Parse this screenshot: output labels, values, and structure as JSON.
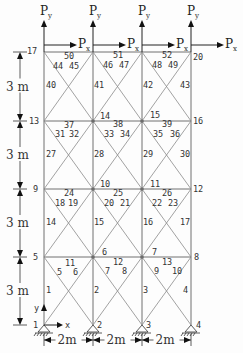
{
  "diagram": {
    "type": "truss-frame",
    "nodes": [
      {
        "id": "1",
        "x": 44,
        "y": 325
      },
      {
        "id": "2",
        "x": 93,
        "y": 325
      },
      {
        "id": "3",
        "x": 142,
        "y": 325
      },
      {
        "id": "4",
        "x": 191,
        "y": 325
      },
      {
        "id": "5",
        "x": 44,
        "y": 257
      },
      {
        "id": "6",
        "x": 93,
        "y": 257
      },
      {
        "id": "7",
        "x": 142,
        "y": 257
      },
      {
        "id": "8",
        "x": 191,
        "y": 257
      },
      {
        "id": "9",
        "x": 44,
        "y": 189
      },
      {
        "id": "10",
        "x": 93,
        "y": 189
      },
      {
        "id": "11",
        "x": 142,
        "y": 189
      },
      {
        "id": "12",
        "x": 191,
        "y": 189
      },
      {
        "id": "13",
        "x": 44,
        "y": 121
      },
      {
        "id": "14",
        "x": 93,
        "y": 121
      },
      {
        "id": "15",
        "x": 142,
        "y": 121
      },
      {
        "id": "16",
        "x": 191,
        "y": 121
      },
      {
        "id": "17",
        "x": 44,
        "y": 52
      },
      {
        "id": "18",
        "x": 93,
        "y": 52
      },
      {
        "id": "19",
        "x": 142,
        "y": 52
      },
      {
        "id": "20",
        "x": 191,
        "y": 52
      }
    ],
    "node_labels": [
      {
        "text": "1",
        "x": 33,
        "y": 328
      },
      {
        "text": "2",
        "x": 97,
        "y": 328
      },
      {
        "text": "3",
        "x": 146,
        "y": 328
      },
      {
        "text": "4",
        "x": 196,
        "y": 328
      },
      {
        "text": "5",
        "x": 33,
        "y": 260
      },
      {
        "text": "6",
        "x": 102,
        "y": 255
      },
      {
        "text": "7",
        "x": 152,
        "y": 255
      },
      {
        "text": "8",
        "x": 194,
        "y": 260
      },
      {
        "text": "9",
        "x": 33,
        "y": 192
      },
      {
        "text": "10",
        "x": 100,
        "y": 187
      },
      {
        "text": "11",
        "x": 150,
        "y": 187
      },
      {
        "text": "12",
        "x": 193,
        "y": 192
      },
      {
        "text": "13",
        "x": 29,
        "y": 124
      },
      {
        "text": "14",
        "x": 100,
        "y": 119
      },
      {
        "text": "15",
        "x": 150,
        "y": 118
      },
      {
        "text": "16",
        "x": 193,
        "y": 124
      },
      {
        "text": "17",
        "x": 27,
        "y": 54
      },
      {
        "text": "20",
        "x": 193,
        "y": 60
      }
    ],
    "member_labels": [
      {
        "text": "1",
        "x": 46,
        "y": 293
      },
      {
        "text": "2",
        "x": 94,
        "y": 293
      },
      {
        "text": "3",
        "x": 143,
        "y": 293
      },
      {
        "text": "4",
        "x": 183,
        "y": 293
      },
      {
        "text": "5",
        "x": 57,
        "y": 275
      },
      {
        "text": "6",
        "x": 73,
        "y": 275
      },
      {
        "text": "7",
        "x": 105,
        "y": 274
      },
      {
        "text": "8",
        "x": 122,
        "y": 274
      },
      {
        "text": "9",
        "x": 154,
        "y": 274
      },
      {
        "text": "10",
        "x": 172,
        "y": 274
      },
      {
        "text": "11",
        "x": 65,
        "y": 266
      },
      {
        "text": "12",
        "x": 113,
        "y": 265
      },
      {
        "text": "13",
        "x": 162,
        "y": 265
      },
      {
        "text": "14",
        "x": 46,
        "y": 225
      },
      {
        "text": "15",
        "x": 94,
        "y": 225
      },
      {
        "text": "16",
        "x": 143,
        "y": 225
      },
      {
        "text": "17",
        "x": 180,
        "y": 225
      },
      {
        "text": "18",
        "x": 55,
        "y": 206
      },
      {
        "text": "19",
        "x": 68,
        "y": 206
      },
      {
        "text": "20",
        "x": 104,
        "y": 206
      },
      {
        "text": "21",
        "x": 120,
        "y": 206
      },
      {
        "text": "22",
        "x": 152,
        "y": 206
      },
      {
        "text": "23",
        "x": 168,
        "y": 206
      },
      {
        "text": "24",
        "x": 64,
        "y": 196
      },
      {
        "text": "25",
        "x": 113,
        "y": 196
      },
      {
        "text": "26",
        "x": 162,
        "y": 196
      },
      {
        "text": "27",
        "x": 46,
        "y": 157
      },
      {
        "text": "28",
        "x": 94,
        "y": 157
      },
      {
        "text": "29",
        "x": 143,
        "y": 157
      },
      {
        "text": "30",
        "x": 180,
        "y": 157
      },
      {
        "text": "31",
        "x": 55,
        "y": 137
      },
      {
        "text": "32",
        "x": 69,
        "y": 137
      },
      {
        "text": "33",
        "x": 104,
        "y": 137
      },
      {
        "text": "34",
        "x": 120,
        "y": 137
      },
      {
        "text": "35",
        "x": 153,
        "y": 137
      },
      {
        "text": "36",
        "x": 170,
        "y": 137
      },
      {
        "text": "37",
        "x": 64,
        "y": 128
      },
      {
        "text": "38",
        "x": 113,
        "y": 127
      },
      {
        "text": "39",
        "x": 162,
        "y": 127
      },
      {
        "text": "40",
        "x": 46,
        "y": 88
      },
      {
        "text": "41",
        "x": 94,
        "y": 88
      },
      {
        "text": "42",
        "x": 143,
        "y": 88
      },
      {
        "text": "43",
        "x": 180,
        "y": 88
      },
      {
        "text": "44",
        "x": 53,
        "y": 69
      },
      {
        "text": "45",
        "x": 69,
        "y": 69
      },
      {
        "text": "46",
        "x": 103,
        "y": 68
      },
      {
        "text": "47",
        "x": 119,
        "y": 68
      },
      {
        "text": "48",
        "x": 152,
        "y": 68
      },
      {
        "text": "49",
        "x": 168,
        "y": 68
      },
      {
        "text": "50",
        "x": 64,
        "y": 59
      },
      {
        "text": "51",
        "x": 113,
        "y": 58
      },
      {
        "text": "52",
        "x": 162,
        "y": 58
      }
    ],
    "loads": [
      {
        "node": "17",
        "vertical": "P",
        "vertical_sub": "y",
        "horizontal": "P",
        "horizontal_sub": "x"
      },
      {
        "node": "18",
        "vertical": "P",
        "vertical_sub": "y",
        "horizontal": "P",
        "horizontal_sub": "x"
      },
      {
        "node": "19",
        "vertical": "P",
        "vertical_sub": "y",
        "horizontal": "P",
        "horizontal_sub": "x"
      },
      {
        "node": "20",
        "vertical": "P",
        "vertical_sub": "y",
        "horizontal": "P",
        "horizontal_sub": "x"
      }
    ],
    "dimensions": {
      "storey_height": "3 m",
      "bay_width": "2m",
      "storeys": [
        "3 m",
        "3 m",
        "3 m",
        "3 m"
      ],
      "bays": [
        "2m",
        "2m",
        "2m"
      ]
    },
    "axes": {
      "x_label": "x",
      "y_label": "y"
    },
    "colors": {
      "member": "#707070",
      "text": "#333333",
      "background": "#fdfdfd"
    }
  }
}
